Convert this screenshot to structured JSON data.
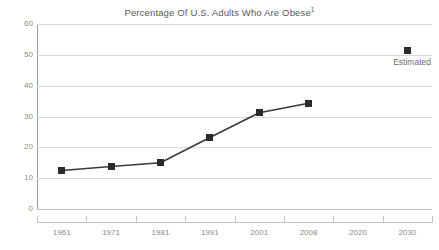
{
  "chart_data": {
    "type": "line",
    "title": "Percentage Of U.S. Adults Who Are Obese",
    "title_superscript": "1",
    "xlabel": "",
    "ylabel": "",
    "categories": [
      "1961",
      "1971",
      "1981",
      "1991",
      "2001",
      "2008",
      "2020",
      "2030"
    ],
    "series": [
      {
        "name": "Observed",
        "values": [
          12.5,
          13.8,
          15.0,
          23.2,
          31.2,
          34.3,
          null,
          null
        ]
      },
      {
        "name": "Estimated",
        "values": [
          null,
          null,
          null,
          null,
          null,
          null,
          null,
          51.5
        ]
      }
    ],
    "ylim": [
      0,
      60
    ],
    "y_ticks": [
      "0",
      "10",
      "20",
      "30",
      "40",
      "50",
      "60"
    ],
    "y_tick_values": [
      0,
      10,
      20,
      30,
      40,
      50,
      60
    ],
    "grid": true,
    "legend": "none",
    "annotations": [
      {
        "text": "Estimated",
        "category": "2030",
        "value": 51.5
      }
    ],
    "colors": {
      "marker": "#2b2b2b",
      "line": "#3a3a3a",
      "grid": "#d9d9d9",
      "axis": "#9a9a9a",
      "text": "#8c8c8c",
      "title": "#58595b",
      "background": "#ffffff"
    }
  }
}
